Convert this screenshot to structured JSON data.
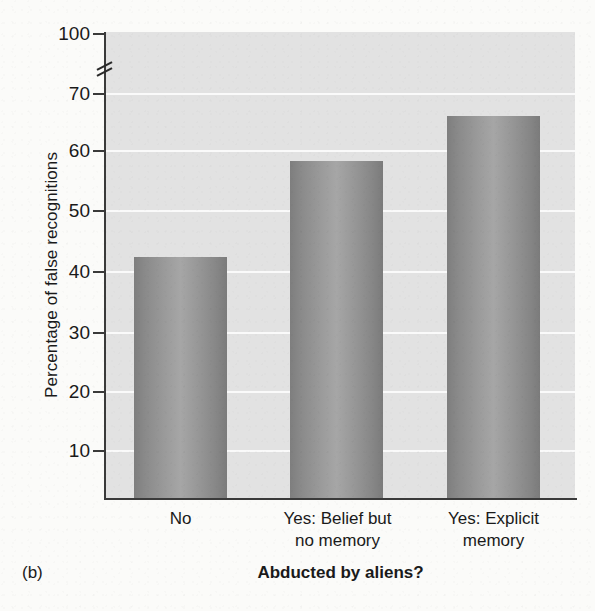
{
  "figure": {
    "panel_label": "(b)",
    "accent_color": "#9a9a9a",
    "plot_background": "#e2e2e2",
    "gridline_color": "#fafafa",
    "axis_color": "#3a3a3a"
  },
  "chart_data": {
    "type": "bar",
    "title": "",
    "xlabel": "Abducted by aliens?",
    "ylabel": "Percentage of false recognitions",
    "categories": [
      "No",
      "Yes: Belief but no memory",
      "Yes: Explicit memory"
    ],
    "category_lines": [
      [
        "No"
      ],
      [
        "Yes: Belief but",
        "no memory"
      ],
      [
        "Yes: Explicit",
        "memory"
      ]
    ],
    "values": [
      42.3,
      59.1,
      66.8
    ],
    "ylim": [
      0,
      100
    ],
    "yticks": [
      10,
      20,
      30,
      40,
      50,
      60,
      70,
      100
    ],
    "ytick_labels": [
      "10",
      "20",
      "30",
      "40",
      "50",
      "60",
      "70",
      "100"
    ],
    "axis_break": {
      "present": true,
      "between": [
        70,
        100
      ],
      "glyph": "double-slash"
    },
    "grid": true,
    "grid_axis": "y",
    "legend": false,
    "series": [
      {
        "name": "Percentage of false recognitions",
        "values": [
          42.3,
          59.1,
          66.8
        ]
      }
    ]
  },
  "axis_pixels": {
    "tick_tops": [
      450,
      391,
      332,
      271,
      210,
      150,
      93,
      42
    ],
    "plot_top": 32,
    "plot_bottom": 498
  },
  "bars": [
    {
      "label": "No",
      "value": 42.3,
      "top_px": 257,
      "height_px": 241
    },
    {
      "label": "Yes: Belief but no memory",
      "value": 59.1,
      "top_px": 161,
      "height_px": 337
    },
    {
      "label": "Yes: Explicit memory",
      "value": 66.8,
      "top_px": 116,
      "height_px": 382
    }
  ]
}
